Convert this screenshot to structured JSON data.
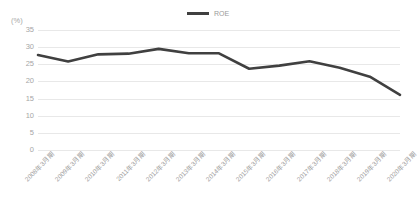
{
  "chart_data": {
    "type": "line",
    "title": "",
    "subtitle": "",
    "xlabel": "",
    "ylabel": "",
    "unit_label": "(%)",
    "categories": [
      "2008年3月期",
      "2009年3月期",
      "2010年3月期",
      "2011年3月期",
      "2012年3月期",
      "2013年3月期",
      "2014年3月期",
      "2015年3月期",
      "2016年3月期",
      "2017年3月期",
      "2018年3月期",
      "2019年3月期",
      "2020年3月期"
    ],
    "series": [
      {
        "name": "ROE",
        "color": "#404040",
        "values": [
          27.7,
          25.8,
          27.9,
          28.1,
          29.5,
          28.2,
          28.2,
          23.7,
          24.6,
          25.9,
          24.0,
          21.4,
          16.1
        ]
      }
    ],
    "ylim": [
      0,
      35
    ],
    "yticks": [
      0,
      5,
      10,
      15,
      20,
      25,
      30,
      35
    ],
    "ytick_labels": [
      "0",
      "5",
      "10",
      "15",
      "20",
      "25",
      "30",
      "35"
    ],
    "grid": true,
    "grid_color": "#e8e8e8",
    "legend": {
      "position": "top-center",
      "entries": [
        {
          "label": "ROE",
          "color": "#404040"
        }
      ]
    },
    "background_color": "#ffffff",
    "axis_text_color": "#a0a0a0"
  }
}
